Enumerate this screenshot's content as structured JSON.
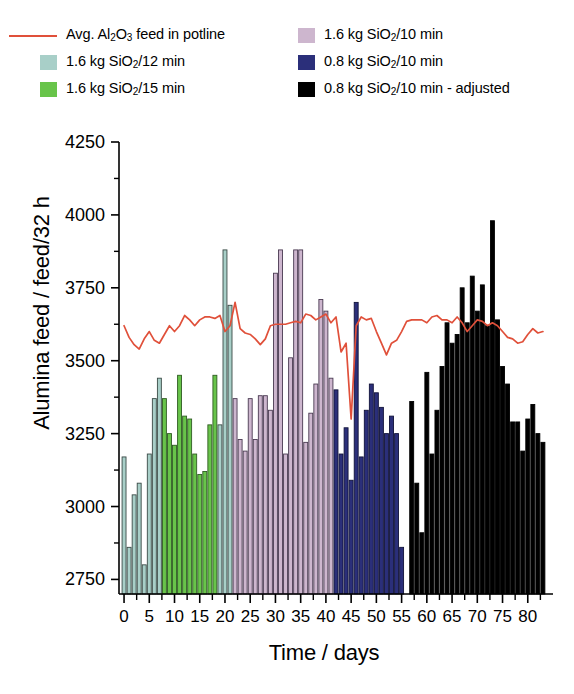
{
  "legend": {
    "columns": [
      {
        "items": [
          {
            "type": "line",
            "color": "#e0503a",
            "label_html": "Avg. Al2O3 feed in potline",
            "name": "legend-avg-feed-line"
          },
          {
            "type": "patch",
            "color": "#a8cfc8",
            "label_html": "1.6 kg SiO2/12 min",
            "name": "legend-sio2-12min"
          },
          {
            "type": "patch",
            "color": "#68c44a",
            "label_html": "1.6 kg SiO2/15 min",
            "name": "legend-sio2-15min"
          }
        ]
      },
      {
        "items": [
          {
            "type": "patch",
            "color": "#cdb6ce",
            "label_html": "1.6 kg SiO2/10 min",
            "name": "legend-sio2-16-10min"
          },
          {
            "type": "patch",
            "color": "#2b2f7a",
            "label_html": "0.8 kg SiO2/10 min",
            "name": "legend-sio2-08-10min"
          },
          {
            "type": "patch",
            "color": "#000000",
            "label_html": "0.8 kg SiO2/10 min - adjusted",
            "name": "legend-sio2-08-10min-adjusted"
          }
        ]
      }
    ]
  },
  "axes": {
    "ylabel": "Alumina feed / feed/32 h",
    "xlabel": "Time / days",
    "yticks": [
      2750,
      3000,
      3250,
      3500,
      3750,
      4000,
      4250
    ],
    "ylim": [
      2700,
      4250
    ],
    "xticks": [
      0,
      5,
      10,
      15,
      20,
      25,
      30,
      35,
      40,
      45,
      50,
      55,
      60,
      65,
      70,
      75,
      80
    ],
    "xlim": [
      -1,
      85
    ],
    "x_minor_step": 2.5
  },
  "chart_data": {
    "type": "bar",
    "title": "",
    "xlabel": "Time / days",
    "ylabel": "Alumina feed / feed/32 h",
    "ylim": [
      2700,
      4250
    ],
    "xlim": [
      -1,
      85
    ],
    "grid": false,
    "legend_position": "above-plot",
    "baseline": 2700,
    "bar_width_days": 0.78,
    "series": [
      {
        "name": "1.6 kg SiO2/12 min",
        "color": "#a8cfc8",
        "edge": "#3a4a46",
        "x": [
          0,
          1,
          2,
          3,
          4,
          5,
          6,
          7,
          19,
          20,
          21
        ],
        "values": [
          3170,
          2860,
          3040,
          3080,
          2800,
          3180,
          3370,
          3440,
          3280,
          3880,
          3690
        ]
      },
      {
        "name": "1.6 kg SiO2/15 min",
        "color": "#68c44a",
        "edge": "#2f5c22",
        "x": [
          8,
          9,
          10,
          11,
          12,
          13,
          14,
          15,
          16,
          17,
          18
        ],
        "values": [
          3370,
          3250,
          3210,
          3450,
          3310,
          3300,
          3180,
          3110,
          3120,
          3280,
          3450
        ]
      },
      {
        "name": "1.6 kg SiO2/10 min",
        "color": "#cdb6ce",
        "edge": "#4a3a52",
        "x": [
          22,
          23,
          24,
          25,
          26,
          27,
          28,
          29,
          30,
          31,
          32,
          33,
          34,
          35,
          36,
          37,
          38,
          39,
          40,
          41
        ],
        "values": [
          3370,
          3230,
          3190,
          3370,
          3230,
          3380,
          3380,
          3330,
          3800,
          3880,
          3180,
          3510,
          3880,
          3880,
          3220,
          3320,
          3420,
          3710,
          3670,
          3440
        ]
      },
      {
        "name": "0.8 kg SiO2/10 min",
        "color": "#2b2f7a",
        "edge": "#11123a",
        "x": [
          42,
          43,
          44,
          45,
          46,
          47,
          48,
          49,
          50,
          51,
          52,
          53,
          54,
          55
        ],
        "values": [
          3400,
          3180,
          3270,
          3090,
          3700,
          3170,
          3330,
          3420,
          3390,
          3340,
          3250,
          3310,
          3250,
          2860
        ]
      },
      {
        "name": "0.8 kg SiO2/10 min - adjusted",
        "color": "#000000",
        "edge": "#000000",
        "x": [
          57,
          58,
          59,
          60,
          61,
          62,
          63,
          64,
          65,
          66,
          67,
          68,
          69,
          70,
          71,
          72,
          73,
          74,
          75,
          76,
          77,
          78,
          79,
          80,
          81,
          82,
          83
        ],
        "values": [
          3360,
          3080,
          2910,
          3460,
          3180,
          3330,
          3480,
          3630,
          3560,
          3590,
          3750,
          3630,
          3790,
          3670,
          3760,
          3620,
          3980,
          3640,
          3480,
          3420,
          3290,
          3290,
          3190,
          3300,
          3350,
          3250,
          3220
        ]
      }
    ],
    "line_series": {
      "name": "Avg. Al2O3 feed in potline",
      "color": "#e0503a",
      "x": [
        0,
        1,
        2,
        3,
        4,
        5,
        6,
        7,
        8,
        9,
        10,
        11,
        12,
        13,
        14,
        15,
        16,
        17,
        18,
        19,
        20,
        21,
        22,
        23,
        24,
        25,
        26,
        27,
        28,
        29,
        30,
        31,
        32,
        33,
        34,
        35,
        36,
        37,
        38,
        39,
        40,
        41,
        42,
        43,
        44,
        45,
        46,
        47,
        48,
        49,
        50,
        51,
        52,
        53,
        54,
        55,
        56,
        57,
        58,
        59,
        60,
        61,
        62,
        63,
        64,
        65,
        66,
        67,
        68,
        69,
        70,
        71,
        72,
        73,
        74,
        75,
        76,
        77,
        78,
        79,
        80,
        81,
        82,
        83
      ],
      "values": [
        3620,
        3580,
        3555,
        3540,
        3575,
        3600,
        3570,
        3560,
        3590,
        3620,
        3600,
        3620,
        3655,
        3640,
        3620,
        3640,
        3650,
        3650,
        3645,
        3655,
        3600,
        3620,
        3700,
        3610,
        3595,
        3590,
        3575,
        3555,
        3575,
        3620,
        3625,
        3625,
        3625,
        3630,
        3635,
        3630,
        3660,
        3655,
        3640,
        3650,
        3660,
        3630,
        3650,
        3530,
        3560,
        3300,
        3620,
        3650,
        3640,
        3645,
        3600,
        3560,
        3520,
        3560,
        3570,
        3600,
        3635,
        3640,
        3640,
        3640,
        3630,
        3650,
        3655,
        3640,
        3640,
        3630,
        3650,
        3630,
        3600,
        3620,
        3640,
        3635,
        3620,
        3630,
        3620,
        3600,
        3580,
        3575,
        3560,
        3565,
        3590,
        3610,
        3595,
        3600
      ]
    }
  }
}
